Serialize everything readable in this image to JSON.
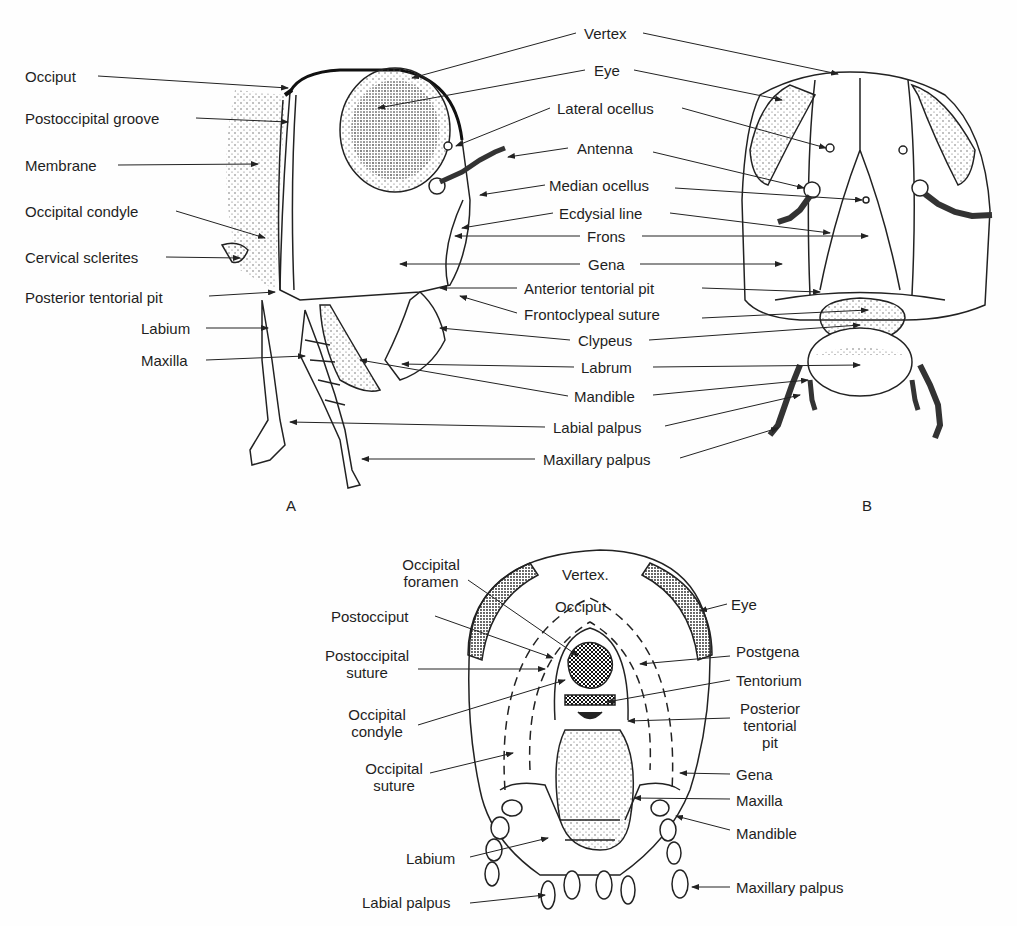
{
  "figure": {
    "panels": [
      {
        "id": "A",
        "label": "A",
        "view": "lateral"
      },
      {
        "id": "B",
        "label": "B",
        "view": "anterior"
      },
      {
        "id": "C",
        "label": "",
        "view": "posterior"
      }
    ]
  },
  "panel_a": {
    "left_labels": [
      "Occiput",
      "Postoccipital groove",
      "Membrane",
      "Occipital condyle",
      "Cervical sclerites",
      "Posterior tentorial pit",
      "Labium",
      "Maxilla"
    ]
  },
  "center_labels": [
    "Vertex",
    "Eye",
    "Lateral ocellus",
    "Antenna",
    "Median ocellus",
    "Ecdysial line",
    "Frons",
    "Gena",
    "Anterior tentorial pit",
    "Frontoclypeal suture",
    "Clypeus",
    "Labrum",
    "Mandible",
    "Labial palpus",
    "Maxillary palpus"
  ],
  "panel_c": {
    "inner_labels": [
      "Vertex.",
      "Occiput"
    ],
    "left_labels": [
      "Occipital foramen",
      "Postocciput",
      "Postoccipital suture",
      "Occipital condyle",
      "Occipital suture",
      "Labium",
      "Labial palpus"
    ],
    "left_labels_lines": [
      [
        "Occipital",
        "foramen"
      ],
      [
        "Postocciput"
      ],
      [
        "Postoccipital",
        "suture"
      ],
      [
        "Occipital",
        "condyle"
      ],
      [
        "Occipital",
        "suture"
      ],
      [
        "Labium"
      ],
      [
        "Labial palpus"
      ]
    ],
    "right_labels": [
      "Eye",
      "Postgena",
      "Tentorium",
      "Posterior tentorial pit",
      "Gena",
      "Maxilla",
      "Mandible",
      "Maxillary palpus"
    ],
    "right_labels_lines": [
      [
        "Eye"
      ],
      [
        "Postgena"
      ],
      [
        "Tentorium"
      ],
      [
        "Posterior",
        "tentorial",
        "pit"
      ],
      [
        "Gena"
      ],
      [
        "Maxilla"
      ],
      [
        "Mandible"
      ],
      [
        "Maxillary palpus"
      ]
    ]
  },
  "colors": {
    "ink": "#1e1e1e",
    "background": "#fefefe",
    "stipple": "#555555"
  }
}
